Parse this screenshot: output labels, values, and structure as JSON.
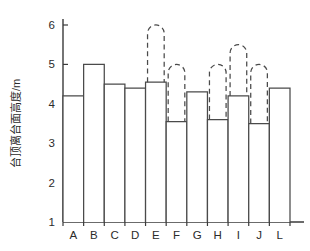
{
  "chart_data": {
    "type": "bar",
    "title": "",
    "xlabel": "",
    "ylabel": "台顶离台面高度/m",
    "ylim": [
      1,
      6
    ],
    "yticks": [
      1,
      2,
      3,
      4,
      5,
      6
    ],
    "ytick_labels": [
      "1",
      "2",
      "3",
      "4",
      "5",
      "6"
    ],
    "grid": false,
    "legend": null,
    "categories": [
      "A",
      "B",
      "C",
      "D",
      "E",
      "F",
      "G",
      "H",
      "I",
      "J",
      "L"
    ],
    "values": [
      4.2,
      5.0,
      4.5,
      4.4,
      4.55,
      3.55,
      4.3,
      3.6,
      4.2,
      3.5,
      4.4
    ],
    "series": [
      {
        "name": "台顶离台面高度",
        "style": "solid-outline-bar",
        "values": [
          4.2,
          5.0,
          4.5,
          4.4,
          4.55,
          3.55,
          4.3,
          3.6,
          4.2,
          3.5,
          4.4
        ]
      },
      {
        "name": "虚线延伸上限",
        "style": "dashed-arch-extension",
        "values": [
          null,
          null,
          null,
          null,
          6.0,
          5.0,
          null,
          5.0,
          5.5,
          5.0,
          null
        ]
      }
    ],
    "annotations": []
  },
  "axes": {
    "y_axis_title": "台顶离台面高度/m",
    "y_min_label": "1",
    "y_max_label": "6"
  }
}
